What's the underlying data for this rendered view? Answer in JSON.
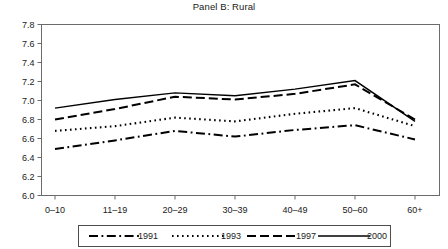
{
  "chart_data": {
    "type": "line",
    "title": "Panel B: Rural",
    "xlabel": "",
    "ylabel": "",
    "categories": [
      "0–10",
      "11–19",
      "20–29",
      "30–39",
      "40–49",
      "50–60",
      "60+"
    ],
    "ylim": [
      6.0,
      7.8
    ],
    "yticks": [
      "6.0",
      "6.2",
      "6.4",
      "6.6",
      "6.8",
      "7.0",
      "7.2",
      "7.4",
      "7.6",
      "7.8"
    ],
    "ytick_values": [
      6.0,
      6.2,
      6.4,
      6.6,
      6.8,
      7.0,
      7.2,
      7.4,
      7.6,
      7.8
    ],
    "grid": false,
    "legend_position": "bottom",
    "series": [
      {
        "name": "1991",
        "dash": "dash-dot",
        "color": "#000000",
        "values": [
          6.49,
          6.58,
          6.68,
          6.62,
          6.69,
          6.74,
          6.59
        ]
      },
      {
        "name": "1993",
        "dash": "dotted",
        "color": "#000000",
        "values": [
          6.68,
          6.73,
          6.82,
          6.78,
          6.86,
          6.92,
          6.73
        ]
      },
      {
        "name": "1997",
        "dash": "dashed",
        "color": "#000000",
        "values": [
          6.8,
          6.91,
          7.04,
          7.01,
          7.07,
          7.17,
          6.8
        ]
      },
      {
        "name": "2000",
        "dash": "solid",
        "color": "#000000",
        "values": [
          6.92,
          7.01,
          7.08,
          7.05,
          7.12,
          7.21,
          6.78
        ]
      }
    ]
  },
  "axes": {
    "y_labels": [
      "7.8",
      "7.6",
      "7.4",
      "7.2",
      "7.0",
      "6.8",
      "6.6",
      "6.4",
      "6.2",
      "6.0"
    ],
    "x_labels": [
      "0–10",
      "11–19",
      "20–29",
      "30–39",
      "40–49",
      "50–60",
      "60+"
    ]
  },
  "legend": {
    "entries": [
      {
        "label": "1991"
      },
      {
        "label": "1993"
      },
      {
        "label": "1997"
      },
      {
        "label": "2000"
      }
    ]
  }
}
